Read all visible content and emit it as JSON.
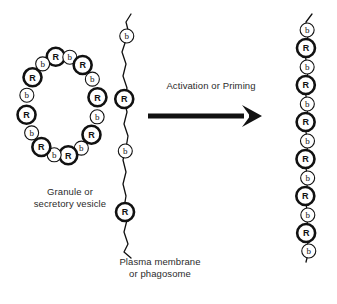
{
  "diagram": {
    "background_color": "#ffffff",
    "ink_color": "#111111"
  },
  "labels": {
    "granule": "Granule or\nsecretory vesicle",
    "membrane": "Plasma membrane\nor phagosome",
    "arrow": "Activation or Priming"
  },
  "glyphs": {
    "receptor": "R",
    "bound": "b"
  },
  "granule_vesicle": {
    "name": "granule-or-secretory-vesicle",
    "shape": "ellipse-ring",
    "center": [
      62,
      106
    ],
    "radius_x": 36,
    "radius_y": 50,
    "count": 16,
    "sequence": [
      "R",
      "b",
      "R",
      "b",
      "R",
      "b",
      "R",
      "b",
      "R",
      "b",
      "R",
      "b",
      "R",
      "b",
      "R",
      "b"
    ],
    "start_angle_deg": -100
  },
  "plasma_membrane": {
    "name": "plasma-membrane-resting",
    "shape": "wavy-vertical-line",
    "count": 4,
    "sequence": [
      "b",
      "R",
      "b",
      "R"
    ],
    "node_y": [
      36,
      99,
      151,
      212
    ],
    "path": "M 131 14 L 126 22 L 128 30 L 126 40 L 122 52 L 126 64 L 123 76 L 127 88 L 124 100 L 127 112 L 124 124 L 128 136 L 126 148 L 123 160 L 126 172 L 123 184 L 126 196 L 124 208 L 127 220 L 124 232 L 128 244 L 124 252 L 131 258"
  },
  "activated_membrane": {
    "name": "plasma-membrane-activated",
    "shape": "wavy-vertical-line-dense",
    "count": 13,
    "sequence": [
      "b",
      "R",
      "b",
      "R",
      "b",
      "R",
      "b",
      "R",
      "b",
      "R",
      "b",
      "R",
      "b"
    ],
    "node_y": [
      30,
      48,
      67,
      85,
      104,
      122,
      141,
      159,
      178,
      196,
      215,
      233,
      251
    ],
    "path": "M 312 14 L 306 22 L 308 36 L 305 54 L 308 72 L 305 90 L 308 108 L 305 126 L 308 144 L 305 162 L 308 180 L 305 198 L 308 216 L 306 234 L 309 250 L 306 262"
  },
  "arrow": {
    "name": "activation-arrow",
    "x1": 148,
    "x2": 262,
    "y": 116,
    "thickness": 5
  },
  "node_style": {
    "r_radius": 9,
    "r_stroke_width": 2.6,
    "b_radius": 7,
    "b_stroke_width": 1.1,
    "fill": "#ffffff",
    "stroke": "#111111"
  }
}
